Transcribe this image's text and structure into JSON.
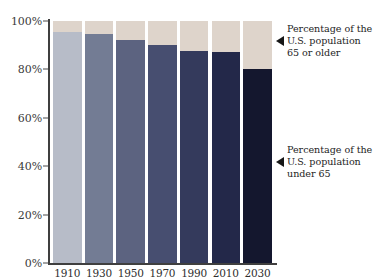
{
  "chart_data": {
    "type": "bar",
    "stacked": true,
    "title": "",
    "subtitle": "",
    "xlabel": "",
    "ylabel": "",
    "categories": [
      "1910",
      "1930",
      "1950",
      "1970",
      "1990",
      "2010",
      "2030"
    ],
    "series": [
      {
        "name": "Percentage of the U.S. population under 65",
        "values": [
          95.5,
          94.5,
          92.0,
          90.0,
          87.5,
          87.0,
          80.0
        ]
      },
      {
        "name": "Percentage of the U.S. population 65 or older",
        "values": [
          4.5,
          5.5,
          8.0,
          10.0,
          12.5,
          13.0,
          20.0
        ]
      }
    ],
    "ylim": [
      0,
      100
    ],
    "yticks": [
      0,
      20,
      40,
      60,
      80,
      100
    ],
    "ytick_labels": [
      "0%",
      "20%",
      "40%",
      "60%",
      "80%",
      "100%"
    ],
    "grid": false,
    "legend": "annotations-right",
    "bar_colors_under_65": [
      "#b7bcc8",
      "#737c94",
      "#5c6380",
      "#474e70",
      "#343a5c",
      "#232849",
      "#14172e"
    ],
    "color_65_or_older": "#ded4cb",
    "axis_color": "#3f3f3f",
    "text_color": "#1d1d1d"
  },
  "annotations": [
    {
      "id": "older",
      "marker": "left-triangle",
      "text": "Percentage of the\nU.S. population\n65 or older"
    },
    {
      "id": "under",
      "marker": "left-triangle",
      "text": "Percentage of the\nU.S. population\nunder 65"
    }
  ]
}
